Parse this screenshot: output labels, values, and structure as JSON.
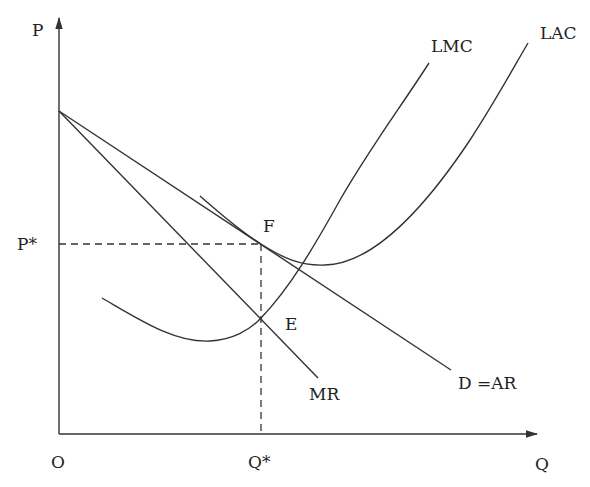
{
  "diagram": {
    "type": "economics-monopolistic-competition-long-run-equilibrium",
    "axes": {
      "y_label": "P",
      "x_label": "Q",
      "origin_label": "O"
    },
    "reference_labels": {
      "price": "P*",
      "quantity": "Q*"
    },
    "curves": {
      "lmc": "LMC",
      "lac": "LAC",
      "mr": "MR",
      "demand": "D =AR"
    },
    "points": {
      "f": "F",
      "e": "E"
    },
    "colors": {
      "line": "#333333",
      "text": "#222222",
      "background": "#ffffff"
    }
  }
}
